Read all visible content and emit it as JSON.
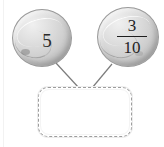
{
  "diagram": {
    "operands": [
      {
        "id": "left-operand",
        "shape": "marble-circle",
        "kind": "whole-number",
        "value": "5",
        "fill_color": "#cfcfcf",
        "outline_color": "#9a9a9a"
      },
      {
        "id": "right-operand",
        "shape": "marble-circle",
        "kind": "fraction",
        "numerator": "3",
        "denominator": "10",
        "fill_color": "#cfcfcf",
        "outline_color": "#9a9a9a"
      }
    ],
    "connector": {
      "name": "connector-lines",
      "color": "#7c7c7c",
      "count": 2
    },
    "answer_box": {
      "name": "answer-box",
      "value": "",
      "placeholder": "",
      "border_style": "dashed",
      "border_color": "#9d9d9d",
      "fill_color": "#ffffff"
    }
  }
}
